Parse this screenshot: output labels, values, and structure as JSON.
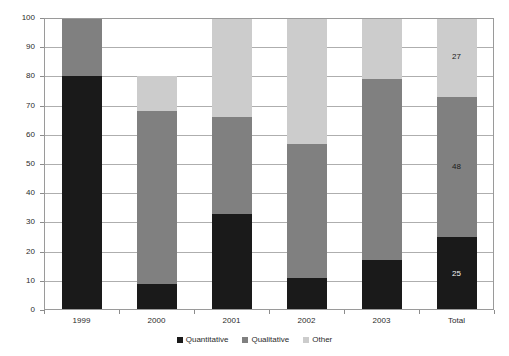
{
  "chart_data": {
    "type": "bar",
    "subtype": "stacked-column",
    "title": "",
    "xlabel": "",
    "ylabel": "",
    "ylim": [
      0,
      100
    ],
    "ytick_step": 10,
    "yticks": [
      0,
      10,
      20,
      30,
      40,
      50,
      60,
      70,
      80,
      90,
      100
    ],
    "ytick_labels": [
      "0",
      "10",
      "20",
      "30",
      "40",
      "50",
      "60",
      "70",
      "80",
      "90",
      "100"
    ],
    "grid": true,
    "grid_axis": "y",
    "legend_position": "bottom",
    "categories": [
      "1999",
      "2000",
      "2001",
      "2002",
      "2003",
      "Total"
    ],
    "series": [
      {
        "name": "Quantitative",
        "color": "#1a1a1a",
        "values": [
          80,
          9,
          33,
          11,
          17,
          25
        ],
        "data_labels": [
          "",
          "",
          "",
          "",
          "",
          "25"
        ]
      },
      {
        "name": "Qualitative",
        "color": "#808080",
        "values": [
          20,
          59,
          33,
          46,
          62,
          48
        ],
        "data_labels": [
          "",
          "",
          "",
          "",
          "",
          "48"
        ]
      },
      {
        "name": "Other",
        "color": "#cccccc",
        "values": [
          0,
          12,
          34,
          43,
          21,
          27
        ],
        "data_labels": [
          "",
          "",
          "",
          "",
          "",
          "27"
        ]
      }
    ],
    "stack_totals": [
      100,
      80,
      100,
      100,
      100,
      100
    ]
  },
  "legend": {
    "items": [
      {
        "label": "Quantitative",
        "color": "#1a1a1a"
      },
      {
        "label": "Qualitative",
        "color": "#808080"
      },
      {
        "label": "Other",
        "color": "#cccccc"
      }
    ]
  }
}
